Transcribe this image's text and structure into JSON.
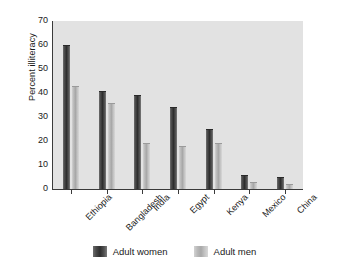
{
  "chart_data": {
    "type": "bar",
    "title": "",
    "subtitle": "",
    "xlabel": "",
    "ylabel": "Percent illiteracy",
    "categories": [
      "Ethiopia",
      "Bangladesh",
      "India",
      "Egypt",
      "Kenya",
      "Mexico",
      "China"
    ],
    "series": [
      {
        "name": "Adult women",
        "color": "#3c3c3c",
        "values": [
          60,
          41,
          39,
          34,
          25,
          6,
          5
        ]
      },
      {
        "name": "Adult men",
        "color": "#b5b5b5",
        "values": [
          43,
          36,
          19,
          18,
          19,
          3,
          2
        ]
      }
    ],
    "ylim": [
      0,
      70
    ],
    "yticks": [
      0,
      10,
      20,
      30,
      40,
      50,
      60,
      70
    ],
    "ytick_labels": [
      "0",
      "10",
      "20",
      "30",
      "40",
      "50",
      "60",
      "70"
    ],
    "grid": false,
    "legend_position": "bottom",
    "plot_background": "#e2e2e2",
    "figure_background": "#ffffff",
    "xtick_label_rotation": -45
  },
  "legend": {
    "entries": [
      {
        "label": "Adult women",
        "swatch": "women-swatch"
      },
      {
        "label": "Adult men",
        "swatch": "men-swatch"
      }
    ]
  }
}
